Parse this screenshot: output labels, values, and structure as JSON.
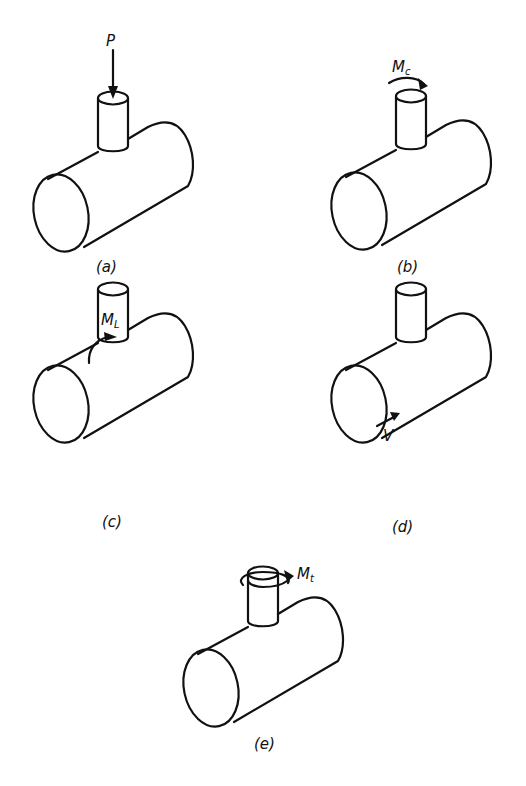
{
  "figure": {
    "panels": [
      {
        "id": "a",
        "caption": "(a)",
        "load_symbol": "P",
        "load_subscript": "",
        "load_type": "radial-force-arrow-icon"
      },
      {
        "id": "b",
        "caption": "(b)",
        "load_symbol": "M",
        "load_subscript": "c",
        "load_type": "circumferential-moment-arrow-icon"
      },
      {
        "id": "c",
        "caption": "(c)",
        "load_symbol": "M",
        "load_subscript": "L",
        "load_type": "longitudinal-moment-arrow-icon"
      },
      {
        "id": "d",
        "caption": "(d)",
        "load_symbol": "V",
        "load_subscript": "",
        "load_type": "shear-force-arrow-icon"
      },
      {
        "id": "e",
        "caption": "(e)",
        "load_symbol": "M",
        "load_subscript": "t",
        "load_type": "torsional-moment-arrow-icon"
      }
    ]
  }
}
